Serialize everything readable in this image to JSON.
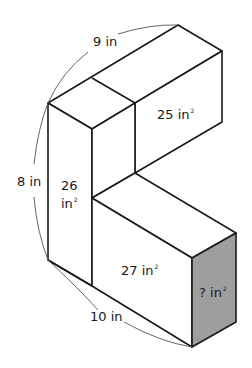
{
  "figure": {
    "type": "L-shaped prism, isometric view",
    "dimensions": {
      "top_depth": {
        "value": "9",
        "unit": "in"
      },
      "height": {
        "value": "8",
        "unit": "in"
      },
      "bottom_length": {
        "value": "10",
        "unit": "in"
      }
    },
    "face_areas": {
      "upper_right_face": {
        "value": "25",
        "unit": "in",
        "power": "2"
      },
      "left_front_face": {
        "value": "26",
        "unit": "in",
        "power": "2"
      },
      "lower_front_face": {
        "value": "27",
        "unit": "in",
        "power": "2"
      },
      "shaded_end_face": {
        "value": "?",
        "unit": "in",
        "power": "2"
      }
    },
    "colors": {
      "line": "#1a1a1a",
      "shaded_face": "#9e9e9e",
      "dimension_arc": "#555555",
      "background": "#ffffff"
    }
  }
}
